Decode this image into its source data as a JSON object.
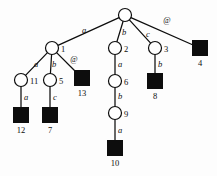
{
  "diagram": {
    "colors": {
      "background": "#fdfdfd",
      "stroke": "#0d0d0d",
      "internal_node_fill": "#ffffff",
      "leaf_node_fill": "#0d0d0d"
    },
    "nodes": [
      {
        "id": "root",
        "label": "",
        "shape": "circle",
        "x": 125,
        "y": 15,
        "r": 6.5,
        "label_dx": 0,
        "label_dy": 0
      },
      {
        "id": "n1",
        "label": "1",
        "shape": "circle",
        "x": 52,
        "y": 48,
        "r": 6.5,
        "label_dx": 9,
        "label_dy": 4
      },
      {
        "id": "n2",
        "label": "2",
        "shape": "circle",
        "x": 115,
        "y": 48,
        "r": 6.5,
        "label_dx": 9,
        "label_dy": 4
      },
      {
        "id": "n3",
        "label": "3",
        "shape": "circle",
        "x": 155,
        "y": 48,
        "r": 6.5,
        "label_dx": 9,
        "label_dy": 4
      },
      {
        "id": "n4",
        "label": "4",
        "shape": "square",
        "x": 200,
        "y": 48,
        "r": 7.5,
        "label_dx": 0,
        "label_dy": 18
      },
      {
        "id": "n11",
        "label": "11",
        "shape": "circle",
        "x": 21,
        "y": 80,
        "r": 6.5,
        "label_dx": 9,
        "label_dy": 4
      },
      {
        "id": "n5",
        "label": "5",
        "shape": "circle",
        "x": 50,
        "y": 80,
        "r": 6.5,
        "label_dx": 9,
        "label_dy": 4
      },
      {
        "id": "n13",
        "label": "13",
        "shape": "square",
        "x": 82,
        "y": 78,
        "r": 7.5,
        "label_dx": 0,
        "label_dy": 18
      },
      {
        "id": "n6",
        "label": "6",
        "shape": "circle",
        "x": 115,
        "y": 81,
        "r": 6.5,
        "label_dx": 9,
        "label_dy": 4
      },
      {
        "id": "n8",
        "label": "8",
        "shape": "square",
        "x": 155,
        "y": 81,
        "r": 7.5,
        "label_dx": 0,
        "label_dy": 18
      },
      {
        "id": "n12",
        "label": "12",
        "shape": "square",
        "x": 21,
        "y": 115,
        "r": 7.5,
        "label_dx": 0,
        "label_dy": 18
      },
      {
        "id": "n7",
        "label": "7",
        "shape": "square",
        "x": 50,
        "y": 115,
        "r": 7.5,
        "label_dx": 0,
        "label_dy": 18
      },
      {
        "id": "n9",
        "label": "9",
        "shape": "circle",
        "x": 115,
        "y": 113,
        "r": 6.5,
        "label_dx": 9,
        "label_dy": 4
      },
      {
        "id": "n10",
        "label": "10",
        "shape": "square",
        "x": 115,
        "y": 148,
        "r": 7.5,
        "label_dx": 0,
        "label_dy": 18
      }
    ],
    "edges": [
      {
        "from": "root",
        "to": "n1",
        "label": "a",
        "italic": true,
        "label_x": 84,
        "label_y": 33
      },
      {
        "from": "root",
        "to": "n2",
        "label": "b",
        "italic": true,
        "label_x": 124,
        "label_y": 35
      },
      {
        "from": "root",
        "to": "n3",
        "label": "c",
        "italic": true,
        "label_x": 148,
        "label_y": 37
      },
      {
        "from": "root",
        "to": "n4",
        "label": "@",
        "italic": false,
        "label_x": 167,
        "label_y": 23
      },
      {
        "from": "n1",
        "to": "n11",
        "label": "a",
        "italic": true,
        "label_x": 36,
        "label_y": 67
      },
      {
        "from": "n1",
        "to": "n5",
        "label": "b",
        "italic": true,
        "label_x": 54,
        "label_y": 67
      },
      {
        "from": "n1",
        "to": "n13",
        "label": "@",
        "italic": false,
        "label_x": 74,
        "label_y": 62
      },
      {
        "from": "n11",
        "to": "n12",
        "label": "a",
        "italic": true,
        "label_x": 26,
        "label_y": 100
      },
      {
        "from": "n5",
        "to": "n7",
        "label": "c",
        "italic": true,
        "label_x": 55,
        "label_y": 100
      },
      {
        "from": "n2",
        "to": "n6",
        "label": "a",
        "italic": true,
        "label_x": 120,
        "label_y": 67
      },
      {
        "from": "n3",
        "to": "n8",
        "label": "b",
        "italic": true,
        "label_x": 160,
        "label_y": 67
      },
      {
        "from": "n6",
        "to": "n9",
        "label": "b",
        "italic": true,
        "label_x": 120,
        "label_y": 99
      },
      {
        "from": "n9",
        "to": "n10",
        "label": "a",
        "italic": true,
        "label_x": 120,
        "label_y": 133
      }
    ]
  }
}
